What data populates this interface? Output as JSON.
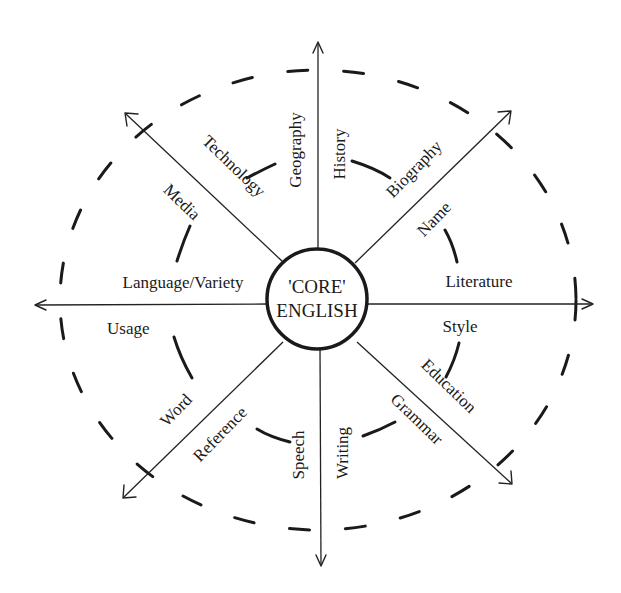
{
  "diagram": {
    "type": "radial-concept-map",
    "center": {
      "line1": "'CORE'",
      "line2": "ENGLISH"
    },
    "labels": {
      "history": "History",
      "geography": "Geography",
      "technology": "Technology",
      "media": "Media",
      "language_variety": "Language/Variety",
      "usage": "Usage",
      "word": "Word",
      "reference": "Reference",
      "speech": "Speech",
      "writing": "Writing",
      "grammar": "Grammar",
      "education": "Education",
      "style": "Style",
      "literature": "Literature",
      "name": "Name",
      "biography": "Biography"
    },
    "axes": [
      "north",
      "north-east",
      "east",
      "south-east",
      "south",
      "south-west",
      "west",
      "north-west"
    ],
    "colors": {
      "ink": "#1a1a1a",
      "background": "#ffffff"
    }
  }
}
